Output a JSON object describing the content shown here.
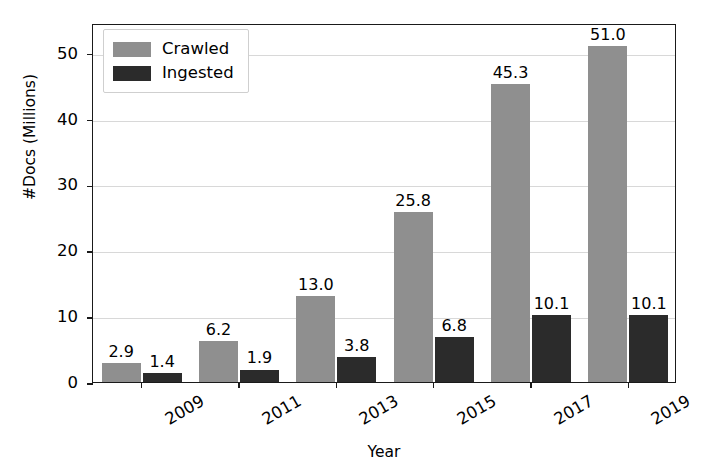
{
  "chart_data": {
    "type": "bar",
    "title": "",
    "xlabel": "Year",
    "ylabel": "#Docs (Millions)",
    "categories": [
      "2009",
      "2011",
      "2013",
      "2015",
      "2017",
      "2019"
    ],
    "series": [
      {
        "name": "Crawled",
        "color": "#8f8f8f",
        "values": [
          2.9,
          6.2,
          13.0,
          25.8,
          45.3,
          51.0
        ]
      },
      {
        "name": "Ingested",
        "color": "#2b2b2b",
        "values": [
          1.4,
          1.9,
          3.8,
          6.8,
          10.1,
          10.1
        ]
      }
    ],
    "value_labels": {
      "Crawled": [
        "2.9",
        "6.2",
        "13.0",
        "25.8",
        "45.3",
        "51.0"
      ],
      "Ingested": [
        "1.4",
        "1.9",
        "3.8",
        "6.8",
        "10.1",
        "10.1"
      ]
    },
    "ylim": [
      0,
      54.5
    ],
    "yticks": [
      0,
      10,
      20,
      30,
      40,
      50
    ],
    "ytick_labels": [
      "0",
      "10",
      "20",
      "30",
      "40",
      "50"
    ],
    "grid": "horizontal",
    "legend_position": "upper-left",
    "xtick_label_rotation": -30
  },
  "legend": {
    "entries": [
      {
        "label": "Crawled"
      },
      {
        "label": "Ingested"
      }
    ]
  }
}
